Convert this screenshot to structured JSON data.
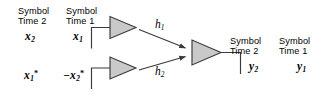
{
  "diagram": {
    "colors": {
      "stroke": "#3a3a3a",
      "antenna_fill": "#c9c9c9",
      "text": "#000000",
      "background": "#ffffff"
    },
    "transmitter": {
      "headers": [
        {
          "line1": "Symbol",
          "line2": "Time 2"
        },
        {
          "line1": "Symbol",
          "line2": "Time 1"
        }
      ],
      "antenna_1": {
        "symbols": [
          {
            "base": "x",
            "sub": "2",
            "sup": "",
            "prefix": ""
          },
          {
            "base": "x",
            "sub": "1",
            "sup": "",
            "prefix": ""
          }
        ]
      },
      "antenna_2": {
        "symbols": [
          {
            "base": "x",
            "sub": "1",
            "sup": "*",
            "prefix": ""
          },
          {
            "base": "x",
            "sub": "2",
            "sup": "*",
            "prefix": "−"
          }
        ]
      }
    },
    "channels": [
      {
        "base": "h",
        "sub": "1",
        "name": "channel-h1"
      },
      {
        "base": "h",
        "sub": "2",
        "name": "channel-h2"
      }
    ],
    "receiver": {
      "headers": [
        {
          "line1": "Symbol",
          "line2": "Time 2"
        },
        {
          "line1": "Symbol",
          "line2": "Time 1"
        }
      ],
      "symbols": [
        {
          "base": "y",
          "sub": "2"
        },
        {
          "base": "y",
          "sub": "1"
        }
      ]
    }
  }
}
